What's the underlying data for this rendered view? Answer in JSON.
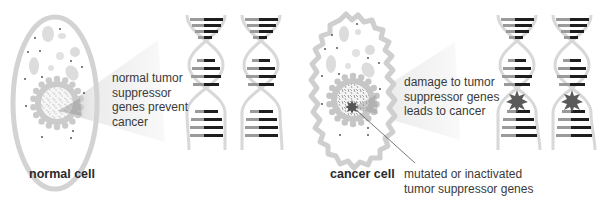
{
  "left_panel": {
    "cell_caption": "normal cell",
    "callout_lines": [
      "normal tumor",
      "suppressor",
      "genes prevent",
      "cancer"
    ]
  },
  "right_panel": {
    "cell_caption": "cancer cell",
    "callout_lines": [
      "damage to tumor",
      "suppressor genes",
      "leads to cancer"
    ],
    "pointer_lines": [
      "mutated or inactivated",
      "tumor suppressor genes"
    ]
  },
  "colors": {
    "membrane": "#d6d6d6",
    "organelle": "#dcdcdc",
    "nucleus_ring": "#c8c8c8",
    "callout_wedge": "#efefef",
    "base_dark": "#1e1e1e",
    "base_light": "#9a9a9a",
    "backbone": "#d8d8d8",
    "mutation_star": "#555555",
    "text": "#3a3a3a"
  }
}
